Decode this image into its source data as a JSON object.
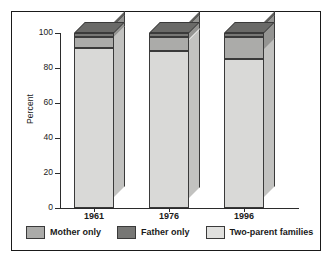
{
  "chart_data": {
    "type": "bar",
    "subtype": "stacked-3d-column",
    "title": "",
    "xlabel": "",
    "ylabel": "Percent",
    "ylim": [
      0,
      100
    ],
    "yticks": [
      0,
      20,
      40,
      60,
      80,
      100
    ],
    "ytick_labels": [
      "0",
      "20",
      "40",
      "60",
      "80",
      "100"
    ],
    "categories": [
      "1961",
      "1976",
      "1996"
    ],
    "grid": false,
    "legend_position": "bottom",
    "stack_order_bottom_to_top": [
      "Two-parent families",
      "Mother only",
      "Father only"
    ],
    "series": [
      {
        "name": "Two-parent families",
        "color": "#d4d4d2",
        "values": [
          91.5,
          90.0,
          85.0
        ]
      },
      {
        "name": "Mother only",
        "color": "#a8a8a6",
        "values": [
          6.5,
          7.5,
          13.0
        ]
      },
      {
        "name": "Father only",
        "color": "#6f6f6d",
        "values": [
          2.0,
          2.5,
          2.0
        ]
      }
    ]
  },
  "axes": {
    "y_title": "Percent",
    "y_labels": [
      "100",
      "80",
      "60",
      "40",
      "20",
      "0"
    ],
    "x_labels": [
      "1961",
      "1976",
      "1996"
    ]
  },
  "legend": {
    "items": [
      {
        "label": "Mother only",
        "color": "#a8a8a6"
      },
      {
        "label": "Father only",
        "color": "#6f6f6d"
      },
      {
        "label": "Two-parent families",
        "color": "#e0e0de"
      }
    ]
  },
  "colors": {
    "frame": "#1a1a1a",
    "axis": "#2b2b2b",
    "background": "#ffffff",
    "two_parent_front": "#d9d9d7",
    "two_parent_side": "#c2c2c0",
    "mother_front": "#ababa9",
    "mother_side": "#949492",
    "father_front": "#777775",
    "father_side": "#5e5e5c",
    "father_top": "#6a6a68"
  }
}
